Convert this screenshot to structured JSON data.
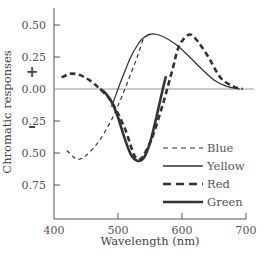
{
  "chart_data": {
    "type": "line",
    "title": "",
    "xlabel": "Wavelength (nm)",
    "ylabel": "Chromatic responses",
    "xlim": [
      400,
      700
    ],
    "ylim": [
      -0.85,
      0.62
    ],
    "x_ticks": [
      "400",
      "500",
      "600",
      "700"
    ],
    "y_ticks": [
      "0.50",
      "0.25",
      "0.00",
      "0.25",
      "0.50",
      "0.75"
    ],
    "y_tick_values": [
      0.5,
      0.25,
      0.0,
      -0.25,
      -0.5,
      -0.75
    ],
    "sign_labels": {
      "positive": "+",
      "negative": "–"
    },
    "grid": false,
    "legend_position": "lower right",
    "series": [
      {
        "name": "Blue",
        "style": "dashed-thin",
        "x": [
          420,
          430,
          438,
          450,
          470,
          490,
          500,
          510,
          520,
          530,
          540
        ],
        "values": [
          -0.48,
          -0.53,
          -0.55,
          -0.52,
          -0.41,
          -0.24,
          -0.13,
          -0.01,
          0.12,
          0.25,
          0.4
        ]
      },
      {
        "name": "Yellow",
        "style": "solid-thin",
        "x": [
          490,
          500,
          510,
          520,
          530,
          540,
          553,
          570,
          590,
          610,
          630,
          650,
          670,
          690
        ],
        "values": [
          -0.14,
          0.0,
          0.13,
          0.25,
          0.34,
          0.4,
          0.43,
          0.41,
          0.35,
          0.26,
          0.16,
          0.07,
          0.02,
          0.0
        ]
      },
      {
        "name": "Red",
        "style": "dashed-thick",
        "x": [
          412,
          420,
          428,
          440,
          455,
          472,
          490,
          510,
          530,
          550,
          570,
          585,
          595,
          609,
          620,
          640,
          660,
          680,
          695
        ],
        "values": [
          0.09,
          0.11,
          0.12,
          0.11,
          0.07,
          0.0,
          -0.1,
          -0.3,
          -0.55,
          -0.42,
          -0.12,
          0.15,
          0.33,
          0.42,
          0.4,
          0.26,
          0.09,
          0.02,
          0.0
        ]
      },
      {
        "name": "Green",
        "style": "solid-thick",
        "x": [
          472,
          480,
          490,
          500,
          510,
          520,
          530,
          540,
          550,
          560,
          570,
          575
        ],
        "values": [
          0.0,
          -0.03,
          -0.1,
          -0.22,
          -0.38,
          -0.51,
          -0.56,
          -0.54,
          -0.42,
          -0.22,
          0.0,
          0.1
        ]
      }
    ]
  },
  "legend": {
    "items": [
      "Blue",
      "Yellow",
      "Red",
      "Green"
    ]
  }
}
